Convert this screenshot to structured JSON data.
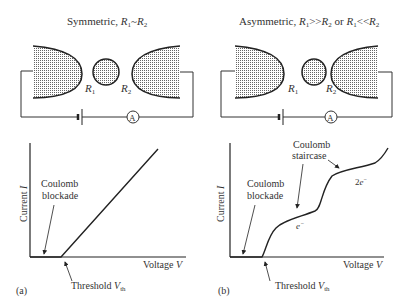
{
  "panels": [
    {
      "id": "a",
      "title_prefix": "Symmetric, ",
      "title_math": "R1~R2",
      "r1_label": "R",
      "r1_sub": "1",
      "r2_label": "R",
      "r2_sub": "2",
      "ammeter": "A",
      "y_label": "Current I",
      "x_label": "Voltage V",
      "annotations": [
        "Coulomb",
        "blockade"
      ],
      "threshold": "Threshold V",
      "threshold_sub": "th",
      "panel_label": "(a)"
    },
    {
      "id": "b",
      "title_prefix": "Asymmetric, ",
      "title_math": "R1>>R2 or R1<<R2",
      "r1_label": "R",
      "r1_sub": "1",
      "r2_label": "R",
      "r2_sub": "2",
      "ammeter": "A",
      "y_label": "Current I",
      "x_label": "Voltage V",
      "annotations": [
        "Coulomb",
        "blockade"
      ],
      "staircase": [
        "Coulomb",
        "staircase"
      ],
      "step1": "e",
      "step2": "2e",
      "threshold": "Threshold V",
      "threshold_sub": "th",
      "panel_label": "(b)"
    }
  ]
}
